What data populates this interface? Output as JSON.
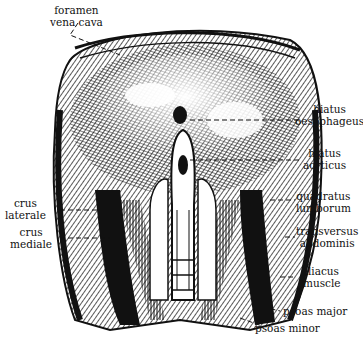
{
  "figure": {
    "labels": {
      "foramen_vena_cava": [
        "foramen",
        "vena cava"
      ],
      "hiatus_oesophageus": [
        "hiatus",
        "oesophageus"
      ],
      "hiatus_aorticus": [
        "hiatus",
        "aorticus"
      ],
      "crus_laterale": [
        "crus",
        "laterale"
      ],
      "crus_mediale": [
        "crus",
        "mediale"
      ],
      "quadratus_lumborum": [
        "quadratus",
        "lumborum"
      ],
      "transversus_abdominis": [
        "transversus",
        "abdominis"
      ],
      "iliacus_muscle": [
        "iliacus",
        "muscle"
      ],
      "psoas_major": "psoas major",
      "psoas_minor": "psoas minor"
    },
    "colors": {
      "ink": "#111111",
      "paper": "#ffffff"
    }
  }
}
